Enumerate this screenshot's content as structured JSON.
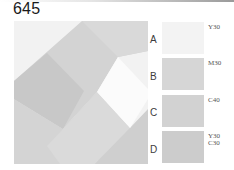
{
  "header": {
    "plate_number": "645"
  },
  "composition": {
    "description": "square composition of overlapping diagonal bands with a white diamond",
    "colors": {
      "background_light": "#f2f2f2",
      "band_upper": "#d3d3d3",
      "band_left_dark": "#c6c6c6",
      "band_lower_mid": "#d9d9d9",
      "lower_left": "#d2d2d2",
      "lower_right": "#cfcfcf",
      "diamond": "#fbfbfb"
    }
  },
  "swatches": [
    {
      "letter": "A",
      "code_line1": "Y30",
      "code_line2": "",
      "color": "#f3f3f3"
    },
    {
      "letter": "B",
      "code_line1": "M30",
      "code_line2": "",
      "color": "#d6d6d6"
    },
    {
      "letter": "C",
      "code_line1": "C40",
      "code_line2": "",
      "color": "#d2d2d2"
    },
    {
      "letter": "D",
      "code_line1": "Y30",
      "code_line2": "C30",
      "color": "#cccccc"
    }
  ]
}
